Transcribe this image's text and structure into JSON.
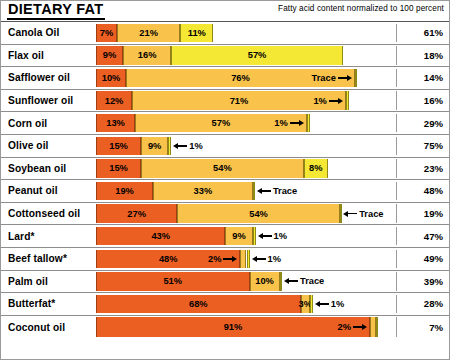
{
  "header": {
    "title": "DIETARY FAT",
    "subtitle": "Fatty acid content normalized to 100 percent"
  },
  "chart_data": {
    "type": "bar",
    "subtype": "stacked-horizontal",
    "title": "DIETARY FAT",
    "subtitle": "Fatty acid content normalized to 100 percent",
    "xlabel": "",
    "ylabel": "",
    "xlim": [
      0,
      100
    ],
    "grid": false,
    "legend_position": "none",
    "unit": "percent",
    "series": [
      {
        "name": "Saturated fat",
        "color": "#ec5f22"
      },
      {
        "name": "Monounsaturated fat",
        "color": "#f8c24b"
      },
      {
        "name": "Polyunsaturated fat",
        "color": "#f4e834"
      },
      {
        "name": "Remainder",
        "color": "#ffffff"
      }
    ],
    "categories": [
      "Canola Oil",
      "Flax oil",
      "Safflower oil",
      "Sunflower oil",
      "Corn oil",
      "Olive oil",
      "Soybean oil",
      "Peanut oil",
      "Cottonseed oil",
      "Lard*",
      "Beef tallow*",
      "Palm oil",
      "Butterfat*",
      "Coconut oil"
    ],
    "values": {
      "saturated": [
        7,
        9,
        10,
        12,
        13,
        15,
        15,
        19,
        27,
        43,
        48,
        51,
        68,
        91
      ],
      "monounsaturated": [
        21,
        16,
        76,
        71,
        57,
        9,
        54,
        33,
        54,
        9,
        2,
        10,
        3,
        2
      ],
      "polyunsaturated": [
        11,
        57,
        0.6,
        1,
        1,
        1,
        8,
        0.6,
        0.6,
        1,
        1,
        0.6,
        1,
        0.8
      ],
      "remainder": [
        61,
        18,
        14,
        16,
        29,
        75,
        23,
        48,
        19,
        47,
        49,
        39,
        28,
        7
      ]
    }
  },
  "rows": [
    {
      "label": "Canola Oil",
      "remainder": "61%",
      "segments": [
        {
          "kind": "sat",
          "pct": 7,
          "label": "7%",
          "style": "inside"
        },
        {
          "kind": "mono",
          "pct": 21,
          "label": "21%",
          "style": "inside"
        },
        {
          "kind": "poly",
          "pct": 11,
          "label": "11%",
          "style": "inside"
        }
      ]
    },
    {
      "label": "Flax oil",
      "remainder": "18%",
      "segments": [
        {
          "kind": "sat",
          "pct": 9,
          "label": "9%",
          "style": "inside"
        },
        {
          "kind": "mono",
          "pct": 16,
          "label": "16%",
          "style": "inside"
        },
        {
          "kind": "poly",
          "pct": 57,
          "label": "57%",
          "style": "inside"
        }
      ]
    },
    {
      "label": "Safflower oil",
      "remainder": "14%",
      "segments": [
        {
          "kind": "sat",
          "pct": 10,
          "label": "10%",
          "style": "inside"
        },
        {
          "kind": "mono",
          "pct": 76,
          "label": "76%",
          "style": "inside"
        },
        {
          "kind": "poly",
          "pct": 0.6,
          "label": "Trace",
          "style": "callout-right"
        }
      ]
    },
    {
      "label": "Sunflower oil",
      "remainder": "16%",
      "segments": [
        {
          "kind": "sat",
          "pct": 12,
          "label": "12%",
          "style": "inside"
        },
        {
          "kind": "mono",
          "pct": 71,
          "label": "71%",
          "style": "inside"
        },
        {
          "kind": "poly",
          "pct": 1,
          "label": "1%",
          "style": "callout-right"
        }
      ]
    },
    {
      "label": "Corn oil",
      "remainder": "29%",
      "segments": [
        {
          "kind": "sat",
          "pct": 13,
          "label": "13%",
          "style": "inside"
        },
        {
          "kind": "mono",
          "pct": 57,
          "label": "57%",
          "style": "inside"
        },
        {
          "kind": "poly",
          "pct": 1,
          "label": "1%",
          "style": "callout-right"
        }
      ]
    },
    {
      "label": "Olive oil",
      "remainder": "75%",
      "segments": [
        {
          "kind": "sat",
          "pct": 15,
          "label": "15%",
          "style": "inside"
        },
        {
          "kind": "mono",
          "pct": 9,
          "label": "9%",
          "style": "inside"
        },
        {
          "kind": "poly",
          "pct": 1,
          "label": "1%",
          "style": "callout-left"
        }
      ]
    },
    {
      "label": "Soybean oil",
      "remainder": "23%",
      "segments": [
        {
          "kind": "sat",
          "pct": 15,
          "label": "15%",
          "style": "inside"
        },
        {
          "kind": "mono",
          "pct": 54,
          "label": "54%",
          "style": "inside"
        },
        {
          "kind": "poly",
          "pct": 8,
          "label": "8%",
          "style": "inside"
        }
      ]
    },
    {
      "label": "Peanut oil",
      "remainder": "48%",
      "segments": [
        {
          "kind": "sat",
          "pct": 19,
          "label": "19%",
          "style": "inside"
        },
        {
          "kind": "mono",
          "pct": 33,
          "label": "33%",
          "style": "inside"
        },
        {
          "kind": "poly",
          "pct": 0.6,
          "label": "Trace",
          "style": "callout-left"
        }
      ]
    },
    {
      "label": "Cottonseed oil",
      "remainder": "19%",
      "segments": [
        {
          "kind": "sat",
          "pct": 27,
          "label": "27%",
          "style": "inside"
        },
        {
          "kind": "mono",
          "pct": 54,
          "label": "54%",
          "style": "inside"
        },
        {
          "kind": "poly",
          "pct": 0.6,
          "label": "Trace",
          "style": "callout-left-tight"
        }
      ]
    },
    {
      "label": "Lard*",
      "remainder": "47%",
      "segments": [
        {
          "kind": "sat",
          "pct": 43,
          "label": "43%",
          "style": "inside"
        },
        {
          "kind": "mono",
          "pct": 9,
          "label": "9%",
          "style": "inside"
        },
        {
          "kind": "poly",
          "pct": 1,
          "label": "1%",
          "style": "callout-left"
        }
      ]
    },
    {
      "label": "Beef tallow*",
      "remainder": "49%",
      "segments": [
        {
          "kind": "sat",
          "pct": 48,
          "label": "48%",
          "style": "inside"
        },
        {
          "kind": "mono",
          "pct": 2,
          "label": "2%",
          "style": "callout-right"
        },
        {
          "kind": "poly",
          "pct": 1,
          "label": "1%",
          "style": "callout-left"
        }
      ]
    },
    {
      "label": "Palm oil",
      "remainder": "39%",
      "segments": [
        {
          "kind": "sat",
          "pct": 51,
          "label": "51%",
          "style": "inside"
        },
        {
          "kind": "mono",
          "pct": 10,
          "label": "10%",
          "style": "inside"
        },
        {
          "kind": "poly",
          "pct": 0.6,
          "label": "Trace",
          "style": "callout-left"
        }
      ]
    },
    {
      "label": "Butterfat*",
      "remainder": "28%",
      "segments": [
        {
          "kind": "sat",
          "pct": 68,
          "label": "68%",
          "style": "inside"
        },
        {
          "kind": "mono",
          "pct": 3,
          "label": "3%",
          "style": "inside"
        },
        {
          "kind": "poly",
          "pct": 1,
          "label": "1%",
          "style": "callout-left"
        }
      ]
    },
    {
      "label": "Coconut oil",
      "remainder": "7%",
      "segments": [
        {
          "kind": "sat",
          "pct": 91,
          "label": "91%",
          "style": "inside"
        },
        {
          "kind": "mono",
          "pct": 2,
          "label": "2%",
          "style": "callout-right"
        },
        {
          "kind": "poly",
          "pct": 0.8,
          "label": "",
          "style": "none"
        }
      ]
    }
  ]
}
